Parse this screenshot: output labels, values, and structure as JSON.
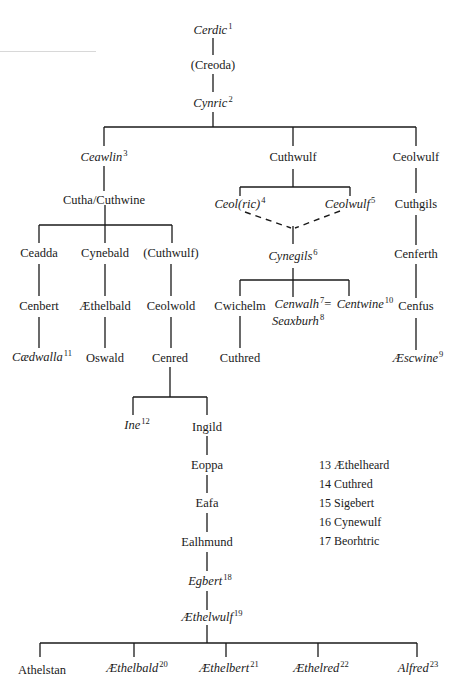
{
  "diagram": {
    "type": "genealogy",
    "nodes": {
      "cerdic": {
        "name": "Cerdic",
        "num": "1",
        "king": true
      },
      "creoda": {
        "name": "(Creoda)",
        "num": "",
        "king": false
      },
      "cynric": {
        "name": "Cynric",
        "num": "2",
        "king": true
      },
      "ceawlin": {
        "name": "Ceawlin",
        "num": "3",
        "king": true
      },
      "cuthwulf": {
        "name": "Cuthwulf",
        "num": "",
        "king": false
      },
      "ceolwulf_a": {
        "name": "Ceolwulf",
        "num": "",
        "king": false
      },
      "cutha": {
        "name": "Cutha/Cuthwine",
        "num": "",
        "king": false
      },
      "ceolric": {
        "name": "Ceol(ric)",
        "num": "4",
        "king": true
      },
      "ceolwulf_k": {
        "name": "Ceolwulf",
        "num": "5",
        "king": true
      },
      "cuthgils": {
        "name": "Cuthgils",
        "num": "",
        "king": false
      },
      "ceadda": {
        "name": "Ceadda",
        "num": "",
        "king": false
      },
      "cynebald": {
        "name": "Cynebald",
        "num": "",
        "king": false
      },
      "cuthwulf_p": {
        "name": "(Cuthwulf)",
        "num": "",
        "king": false
      },
      "cynegils": {
        "name": "Cynegils",
        "num": "6",
        "king": true
      },
      "cenferth": {
        "name": "Cenferth",
        "num": "",
        "king": false
      },
      "cenbert": {
        "name": "Cenbert",
        "num": "",
        "king": false
      },
      "aethelbald_a": {
        "name": "Æthelbald",
        "num": "",
        "king": false
      },
      "ceolwold": {
        "name": "Ceolwold",
        "num": "",
        "king": false
      },
      "cwichelm": {
        "name": "Cwichelm",
        "num": "",
        "king": false
      },
      "cenwalh": {
        "name": "Cenwalh",
        "num": "7",
        "suffix": "=",
        "king": true
      },
      "seaxburh": {
        "name": "Seaxburh",
        "num": "8",
        "king": true
      },
      "centwine": {
        "name": "Centwine",
        "num": "10",
        "king": true
      },
      "cenfus": {
        "name": "Cenfus",
        "num": "",
        "king": false
      },
      "caedwalla": {
        "name": "Cædwalla",
        "num": "11",
        "king": true
      },
      "oswald": {
        "name": "Oswald",
        "num": "",
        "king": false
      },
      "cenred": {
        "name": "Cenred",
        "num": "",
        "king": false
      },
      "cuthred_a": {
        "name": "Cuthred",
        "num": "",
        "king": false
      },
      "aescwine": {
        "name": "Æscwine",
        "num": "9",
        "king": true
      },
      "ine": {
        "name": "Ine",
        "num": "12",
        "king": true
      },
      "ingild": {
        "name": "Ingild",
        "num": "",
        "king": false
      },
      "eoppa": {
        "name": "Eoppa",
        "num": "",
        "king": false
      },
      "eafa": {
        "name": "Eafa",
        "num": "",
        "king": false
      },
      "ealhmund": {
        "name": "Ealhmund",
        "num": "",
        "king": false
      },
      "egbert": {
        "name": "Egbert",
        "num": "18",
        "king": true
      },
      "aethelwulf": {
        "name": "Æthelwulf",
        "num": "19",
        "king": true
      },
      "athelstan": {
        "name": "Athelstan",
        "num": "",
        "king": false
      },
      "aethelbald": {
        "name": "Æthelbald",
        "num": "20",
        "king": true
      },
      "aethelbert": {
        "name": "Æthelbert",
        "num": "21",
        "king": true
      },
      "aethelred": {
        "name": "Æthelred",
        "num": "22",
        "king": true
      },
      "alfred": {
        "name": "Alfred",
        "num": "23",
        "king": true
      }
    },
    "legend": [
      "13  Æthelheard",
      "14  Cuthred",
      "15  Sigebert",
      "16  Cynewulf",
      "17  Beorhtric"
    ],
    "line_color": "#1a1a1a"
  }
}
